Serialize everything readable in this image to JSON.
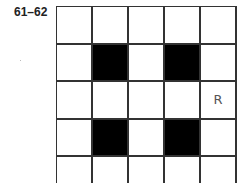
{
  "puzzle": {
    "label": "61–62",
    "rows": 5,
    "cols": 5,
    "cells": [
      [
        {
          "fill": "white",
          "mark": ""
        },
        {
          "fill": "white",
          "mark": ""
        },
        {
          "fill": "white",
          "mark": ""
        },
        {
          "fill": "white",
          "mark": ""
        },
        {
          "fill": "white",
          "mark": ""
        }
      ],
      [
        {
          "fill": "white",
          "mark": ""
        },
        {
          "fill": "black",
          "mark": ""
        },
        {
          "fill": "white",
          "mark": ""
        },
        {
          "fill": "black",
          "mark": ""
        },
        {
          "fill": "white",
          "mark": ""
        }
      ],
      [
        {
          "fill": "white",
          "mark": ""
        },
        {
          "fill": "white",
          "mark": ""
        },
        {
          "fill": "white",
          "mark": ""
        },
        {
          "fill": "white",
          "mark": ""
        },
        {
          "fill": "white",
          "mark": "R"
        }
      ],
      [
        {
          "fill": "white",
          "mark": ""
        },
        {
          "fill": "black",
          "mark": ""
        },
        {
          "fill": "white",
          "mark": ""
        },
        {
          "fill": "black",
          "mark": ""
        },
        {
          "fill": "white",
          "mark": ""
        }
      ],
      [
        {
          "fill": "white",
          "mark": ""
        },
        {
          "fill": "white",
          "mark": ""
        },
        {
          "fill": "white",
          "mark": ""
        },
        {
          "fill": "white",
          "mark": ""
        },
        {
          "fill": "white",
          "mark": ""
        }
      ]
    ],
    "colors": {
      "line": "#333333",
      "filled": "#000000",
      "empty": "#ffffff",
      "mark": "#555555"
    }
  }
}
